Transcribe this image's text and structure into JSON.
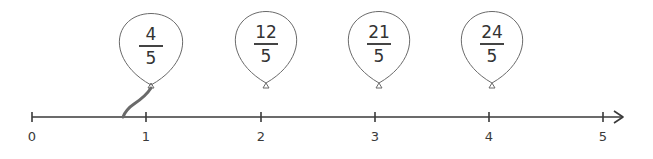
{
  "number_line": {
    "ticks": [
      {
        "value": 0,
        "label": "0",
        "x": 32
      },
      {
        "value": 1,
        "label": "1",
        "x": 146
      },
      {
        "value": 2,
        "label": "2",
        "x": 261
      },
      {
        "value": 3,
        "label": "3",
        "x": 375
      },
      {
        "value": 4,
        "label": "4",
        "x": 489
      },
      {
        "value": 5,
        "label": "5",
        "x": 603
      }
    ],
    "line_color": "#3a3a3a"
  },
  "balloons": [
    {
      "numerator": "4",
      "denominator": "5",
      "center_x": 151,
      "has_string": true,
      "string_end_value": 0.8
    },
    {
      "numerator": "12",
      "denominator": "5",
      "center_x": 266,
      "has_string": false
    },
    {
      "numerator": "21",
      "denominator": "5",
      "center_x": 379,
      "has_string": false
    },
    {
      "numerator": "24",
      "denominator": "5",
      "center_x": 492,
      "has_string": false
    }
  ]
}
